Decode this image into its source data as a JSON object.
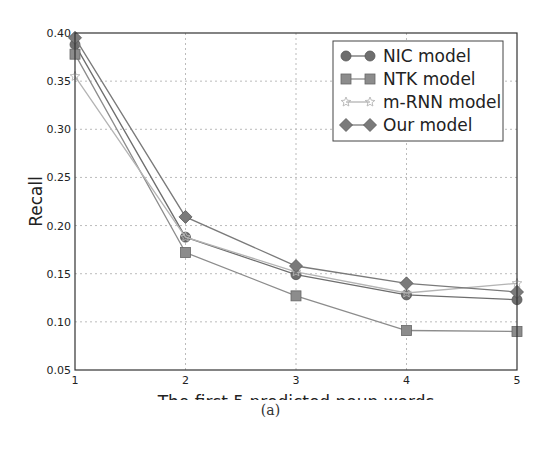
{
  "caption": "(a)",
  "chart_data": {
    "type": "line",
    "title": "",
    "xlabel": "The first 5 predicted noun words",
    "ylabel": "Recall",
    "x": [
      1,
      2,
      3,
      4,
      5
    ],
    "xticks": [
      "1",
      "2",
      "3",
      "4",
      "5"
    ],
    "yticks": [
      "0.05",
      "0.10",
      "0.15",
      "0.20",
      "0.25",
      "0.30",
      "0.35",
      "0.40"
    ],
    "xlim": [
      1,
      5
    ],
    "ylim": [
      0.05,
      0.4
    ],
    "grid": true,
    "legend_position": "upper right",
    "series": [
      {
        "name": "NIC model",
        "marker": "circle",
        "color": "#6e6e6e",
        "values": [
          0.388,
          0.188,
          0.149,
          0.128,
          0.123
        ]
      },
      {
        "name": "NTK model",
        "marker": "square",
        "color": "#8c8c8c",
        "values": [
          0.378,
          0.172,
          0.127,
          0.091,
          0.09
        ]
      },
      {
        "name": "m-RNN model",
        "marker": "star",
        "color": "#b4b4b4",
        "values": [
          0.355,
          0.188,
          0.152,
          0.13,
          0.14
        ]
      },
      {
        "name": "Our model",
        "marker": "diamond",
        "color": "#7a7a7a",
        "values": [
          0.395,
          0.209,
          0.158,
          0.14,
          0.131
        ]
      }
    ]
  }
}
